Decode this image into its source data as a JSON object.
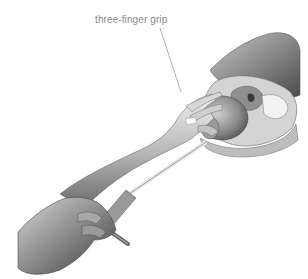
{
  "figure": {
    "annotation": {
      "label": "three-finger grip",
      "color": "#8a8a8a"
    },
    "subjects": [
      "operator-hand-upper",
      "operator-forearm",
      "operator-hand-lower",
      "instrument-shaft",
      "instrument-handle",
      "anatomical-model"
    ],
    "palette": {
      "background": "#ffffff",
      "skin_light": "#e6e6e6",
      "skin_mid": "#b8b8b8",
      "skin_dark": "#5a5a5a",
      "leader_line": "#9a9a9a"
    }
  }
}
